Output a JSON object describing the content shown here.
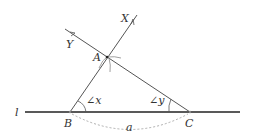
{
  "diagram": {
    "points": {
      "A": {
        "label": "A",
        "x": 107,
        "y": 57
      },
      "B": {
        "label": "B",
        "x": 70,
        "y": 112
      },
      "C": {
        "label": "C",
        "x": 190,
        "y": 112
      },
      "X": {
        "label": "X",
        "x": 137,
        "y": 15
      },
      "Y": {
        "label": "Y",
        "x": 65,
        "y": 29
      }
    },
    "line_label": "l",
    "angle_x_label": "∠x",
    "angle_y_label": "∠y",
    "side_label": "a",
    "colors": {
      "line": "#333333",
      "construction": "#888888",
      "dashed": "#999999"
    }
  }
}
